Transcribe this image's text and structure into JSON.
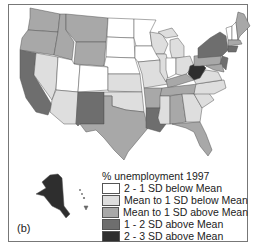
{
  "figure": {
    "panel_label": "(b)"
  },
  "legend": {
    "title": "% unemployment 1997",
    "items": [
      {
        "label": "2 - 1 SD below Mean",
        "color": "#ffffff"
      },
      {
        "label": "Mean to 1 SD below Mean",
        "color": "#dedede"
      },
      {
        "label": "Mean to 1 SD above Mean",
        "color": "#a8a8a8"
      },
      {
        "label": "1 - 2 SD above Mean",
        "color": "#6e6e6e"
      },
      {
        "label": "2 - 3 SD above Mean",
        "color": "#2e2e2e"
      }
    ]
  },
  "colors": {
    "c0": "#ffffff",
    "c1": "#dedede",
    "c2": "#a8a8a8",
    "c3": "#6e6e6e",
    "c4": "#2e2e2e",
    "border": "#555555"
  }
}
